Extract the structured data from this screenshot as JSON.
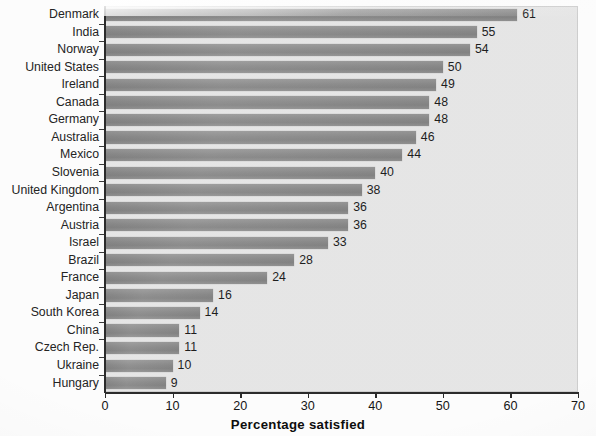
{
  "chart_data": {
    "type": "bar",
    "orientation": "horizontal",
    "title": "",
    "xlabel": "Percentage satisfied",
    "ylabel": "",
    "xlim": [
      0,
      70
    ],
    "xticks": [
      0,
      10,
      20,
      30,
      40,
      50,
      60,
      70
    ],
    "grid": false,
    "legend": null,
    "categories": [
      "Denmark",
      "India",
      "Norway",
      "United States",
      "Ireland",
      "Canada",
      "Germany",
      "Australia",
      "Mexico",
      "Slovenia",
      "United Kingdom",
      "Argentina",
      "Austria",
      "Israel",
      "Brazil",
      "France",
      "Japan",
      "South Korea",
      "China",
      "Czech Rep.",
      "Ukraine",
      "Hungary"
    ],
    "values": [
      61,
      55,
      54,
      50,
      49,
      48,
      48,
      46,
      44,
      40,
      38,
      36,
      36,
      33,
      28,
      24,
      16,
      14,
      11,
      11,
      10,
      9
    ],
    "value_labels": [
      "61",
      "55",
      "54",
      "50",
      "49",
      "48",
      "48",
      "46",
      "44",
      "40",
      "38",
      "36",
      "36",
      "33",
      "28",
      "24",
      "16",
      "14",
      "11",
      "11",
      "10",
      "9"
    ],
    "bar_color": "#8c8c8c",
    "plot_background": "#e7e7e7",
    "axis_color": "#2b2b2b",
    "text_color": "#1e1e1e"
  },
  "axis": {
    "x_title": "Percentage satisfied",
    "tick_labels": [
      "0",
      "10",
      "20",
      "30",
      "40",
      "50",
      "60",
      "70"
    ]
  }
}
